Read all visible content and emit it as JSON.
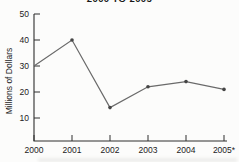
{
  "chart_data": {
    "type": "line",
    "title": "2000 TO 2005",
    "title_note": "title partially cropped by top edge of screenshot",
    "xlabel": "",
    "ylabel": "Millions of Dollars",
    "categories": [
      "2000",
      "2001",
      "2002",
      "2003",
      "2004",
      "2005*"
    ],
    "series": [
      {
        "name": "Millions of Dollars",
        "values": [
          30,
          40,
          14,
          22,
          24,
          21
        ]
      }
    ],
    "yticks": [
      10,
      20,
      30,
      40,
      50
    ],
    "ylim": [
      0,
      50
    ],
    "grid": false,
    "legend": "none",
    "marker_point_indices": [
      1,
      2,
      3,
      4,
      5
    ],
    "tick_direction": "inward"
  },
  "colors": {
    "background": "#fcfcfb",
    "axis": "#2e2e2e",
    "line": "#6a6a6a",
    "marker": "#454545",
    "text": "#1b1b1b"
  }
}
